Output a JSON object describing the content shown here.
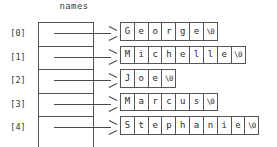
{
  "diagram": {
    "array_label": "names",
    "indices": [
      "[0]",
      "[1]",
      "[2]",
      "[3]",
      "[4]"
    ],
    "arrow_glyph": "arrow-right",
    "terminator": "\\0",
    "colors": {
      "stroke": "#555555",
      "text": "#2b2b2b",
      "background": "#ffffff"
    },
    "strings": [
      {
        "index": "[0]",
        "value": "George",
        "cells": [
          "G",
          "e",
          "o",
          "r",
          "g",
          "e",
          "\\0"
        ]
      },
      {
        "index": "[1]",
        "value": "Michelle",
        "cells": [
          "M",
          "i",
          "c",
          "h",
          "e",
          "l",
          "l",
          "e",
          "\\0"
        ]
      },
      {
        "index": "[2]",
        "value": "Joe",
        "cells": [
          "J",
          "o",
          "e",
          "\\0"
        ]
      },
      {
        "index": "[3]",
        "value": "Marcus",
        "cells": [
          "M",
          "a",
          "r",
          "c",
          "u",
          "s",
          "\\0"
        ]
      },
      {
        "index": "[4]",
        "value": "Stephanie",
        "cells": [
          "S",
          "t",
          "e",
          "p",
          "h",
          "a",
          "n",
          "i",
          "e",
          "\\0"
        ]
      }
    ]
  }
}
